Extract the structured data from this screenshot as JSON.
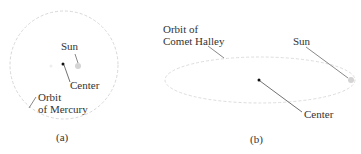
{
  "figure_a": {
    "caption": "(a)",
    "sun_label": "Sun",
    "center_label": "Center",
    "orbit_label_line1": "Orbit",
    "orbit_label_line2": "of Mercury"
  },
  "figure_b": {
    "caption": "(b)",
    "sun_label": "Sun",
    "center_label": "Center",
    "orbit_label_line1": "Orbit of",
    "orbit_label_line2": "Comet Halley"
  },
  "colors": {
    "orbit": "#d8d8d8",
    "sun": "#d0d0d0",
    "center_dot": "#111111",
    "leader": "#444444"
  }
}
